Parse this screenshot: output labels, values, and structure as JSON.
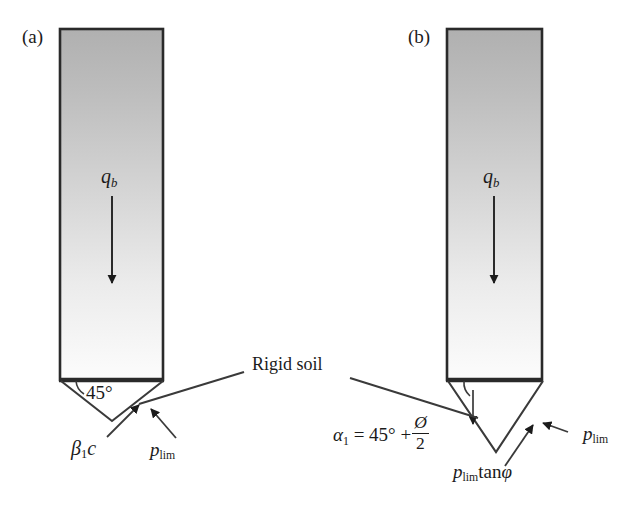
{
  "figure": {
    "width": 640,
    "height": 508,
    "background": "#ffffff",
    "ink_color": "#1b1b1b",
    "shaft_fill_top": "#b4b4b4",
    "shaft_fill_bottom": "#fbfbfb"
  },
  "panels": [
    {
      "id": "a",
      "label": "(a)",
      "shaft": {
        "x": 60,
        "y": 29,
        "width": 103,
        "height": 351
      },
      "tip_angle_label": "45°",
      "tip_type": "shallow-wedge",
      "load_label_html": "<i>q</i><span class=\"sub-ital\">b</span>",
      "load_label_text": "q_b",
      "force_labels": [
        {
          "name": "beta1c",
          "text": "β₁c"
        },
        {
          "name": "p-lim",
          "text": "p_lim"
        }
      ]
    },
    {
      "id": "b",
      "label": "(b)",
      "shaft": {
        "x": 447,
        "y": 29,
        "width": 95,
        "height": 351
      },
      "tip_angle_label": "α₁ = 45° + Ø/2",
      "tip_type": "deep-wedge",
      "load_label_html": "<i>q</i><span class=\"sub-ital\">b</span>",
      "load_label_text": "q_b",
      "force_labels": [
        {
          "name": "p-lim-tan-phi",
          "text": "p_lim tanφ"
        },
        {
          "name": "p-lim",
          "text": "p_lim"
        }
      ]
    }
  ],
  "annotations": {
    "rigid_soil": "Rigid soil"
  },
  "labels": {
    "panel_a": "(a)",
    "panel_b": "(b)",
    "angle_45": "45°",
    "alpha_eq_lead": "= 45° +",
    "alpha_symbol": "α",
    "alpha_sub": "1",
    "phi_slashed": "Ø",
    "denominator_2": "2",
    "beta_symbol": "β",
    "beta_sub": "1",
    "c_symbol": "c",
    "p_symbol": "p",
    "lim_sub": "lim",
    "tan_text": "tan",
    "phi_symbol": "φ",
    "q_symbol": "q",
    "b_sub": "b",
    "rigid_soil": "Rigid soil"
  }
}
